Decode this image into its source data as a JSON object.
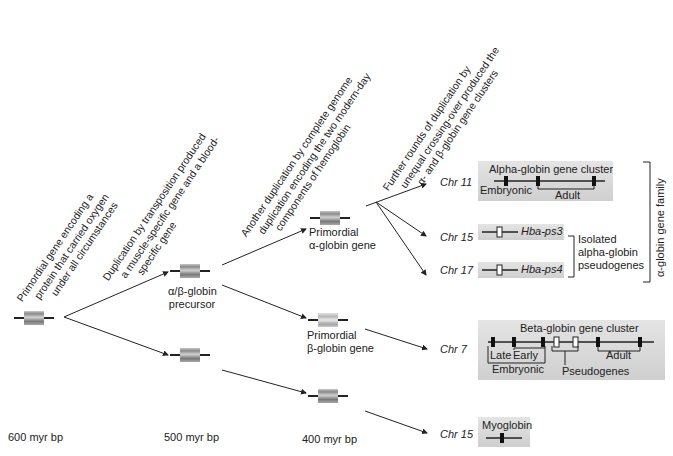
{
  "annotations": {
    "step1": [
      "Primordial gene encoding a",
      "protein that carried oxygen",
      "under all circumstances"
    ],
    "step2": [
      "Duplication by transposition produced",
      "a muscle-specific gene and a blood-",
      "specific gene"
    ],
    "step3": [
      "Another duplication by complete genome",
      "duplication encoding the two modern-day",
      "components of hemoglobin"
    ],
    "step4": [
      "Further rounds of duplication by",
      "unequal crossing-over produced the",
      "α- and β-globin gene clusters"
    ]
  },
  "nodes": {
    "ab_precursor": [
      "α/β-globin",
      "precursor"
    ],
    "alpha_primordial": [
      "Primordial",
      "α-globin gene"
    ],
    "beta_primordial": [
      "Primordial",
      "β-globin gene"
    ]
  },
  "timeline": [
    "600 myr bp",
    "500 myr bp",
    "400 myr bp"
  ],
  "chromosomes": {
    "chr11": "Chr 11",
    "chr15a": "Chr 15",
    "chr17": "Chr 17",
    "chr7": "Chr 7",
    "chr15b": "Chr 15"
  },
  "alpha_cluster": {
    "title": "Alpha-globin gene cluster",
    "embryonic": "Embryonic",
    "adult": "Adult"
  },
  "pseudogenes": {
    "ps3": "Hba-ps3",
    "ps4": "Hba-ps4",
    "label": [
      "Isolated",
      "alpha-globin",
      "pseudogenes"
    ]
  },
  "alpha_family": "α-globin gene family",
  "beta_cluster": {
    "title": "Beta-globin gene cluster",
    "late": "Late",
    "early": "Early",
    "embryonic": "Embryonic",
    "pseudogenes": "Pseudogenes",
    "adult": "Adult"
  },
  "myoglobin": {
    "title": "Myoglobin"
  },
  "colors": {
    "box": "#d9d9d9",
    "line": "#222222",
    "gene": "#8a8a8a"
  }
}
